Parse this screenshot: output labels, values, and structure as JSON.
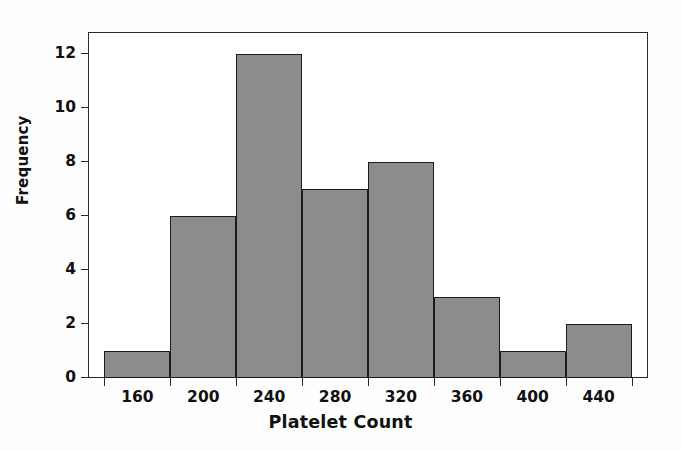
{
  "chart_data": {
    "type": "bar",
    "title": "",
    "xlabel": "Platelet Count",
    "ylabel": "Frequency",
    "categories": [
      "140-180",
      "180-220",
      "220-260",
      "260-300",
      "300-340",
      "340-380",
      "380-420",
      "420-460"
    ],
    "bin_edges": [
      140,
      180,
      220,
      260,
      300,
      340,
      380,
      420,
      460
    ],
    "bin_width": 40,
    "values": [
      1,
      6,
      12,
      7,
      8,
      3,
      1,
      2
    ],
    "xtick_labels": [
      "160",
      "200",
      "240",
      "280",
      "320",
      "360",
      "400",
      "440"
    ],
    "xtick_values": [
      160,
      200,
      240,
      280,
      320,
      360,
      400,
      440
    ],
    "ytick_labels": [
      "0",
      "2",
      "4",
      "6",
      "8",
      "10",
      "12"
    ],
    "ytick_values": [
      0,
      2,
      4,
      6,
      8,
      10,
      12
    ],
    "xlim": [
      130,
      470
    ],
    "ylim": [
      0,
      12.8
    ],
    "grid": false,
    "legend": false,
    "total_count": 40,
    "colors": {
      "bar_fill": "#8c8c8c",
      "bar_edge": "#1c1c1c",
      "axis": "#2b2b2b",
      "text": "#111111",
      "background": "#ffffff"
    }
  }
}
